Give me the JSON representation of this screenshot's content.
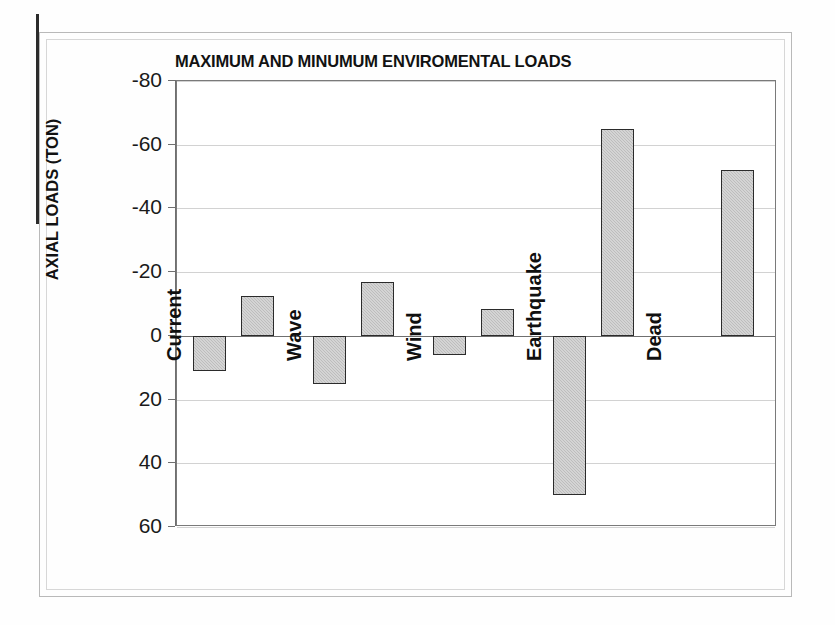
{
  "chart_data": {
    "type": "bar",
    "title": "MAXIMUM AND MINUMUM ENVIROMENTAL LOADS",
    "xlabel": "",
    "ylabel": "AXIAL LOADS (TON)",
    "ylim": [
      -80,
      60
    ],
    "y_axis_inverted": true,
    "grid": true,
    "legend": "none",
    "y_ticks": [
      -80,
      -60,
      -40,
      -20,
      0,
      20,
      40,
      60
    ],
    "y_tick_labels": [
      "-80",
      "-60",
      "-40",
      "-20",
      "0",
      "20",
      "40",
      "60"
    ],
    "categories": [
      "Current",
      "Wave",
      "Wind",
      "Earthquake",
      "Dead"
    ],
    "series": [
      {
        "name": "Maximum",
        "values": [
          -12.5,
          -17,
          -8.5,
          -65,
          -52
        ]
      },
      {
        "name": "Minimum",
        "values": [
          11,
          15,
          6,
          50,
          0
        ]
      }
    ]
  },
  "axis": {
    "y_title": "AXIAL LOADS (TON)",
    "ticks": [
      {
        "label": "-80",
        "value": -80
      },
      {
        "label": "-60",
        "value": -60
      },
      {
        "label": "-40",
        "value": -40
      },
      {
        "label": "-20",
        "value": -20
      },
      {
        "label": "0",
        "value": 0
      },
      {
        "label": "20",
        "value": 20
      },
      {
        "label": "40",
        "value": 40
      },
      {
        "label": "60",
        "value": 60
      }
    ]
  },
  "bars": [
    {
      "category": "Current",
      "series": "Minimum",
      "value": 11
    },
    {
      "category": "Current",
      "series": "Maximum",
      "value": -12.5
    },
    {
      "category": "Wave",
      "series": "Minimum",
      "value": 15
    },
    {
      "category": "Wave",
      "series": "Maximum",
      "value": -17
    },
    {
      "category": "Wind",
      "series": "Minimum",
      "value": 6
    },
    {
      "category": "Wind",
      "series": "Maximum",
      "value": -8.5
    },
    {
      "category": "Earthquake",
      "series": "Minimum",
      "value": 50
    },
    {
      "category": "Earthquake",
      "series": "Maximum",
      "value": -65
    },
    {
      "category": "Dead",
      "series": "Maximum",
      "value": -52
    }
  ],
  "category_labels": [
    "Current",
    "Wave",
    "Wind",
    "Earthquake",
    "Dead"
  ],
  "colors": {
    "bar_fill": "#bdbdbd",
    "bar_border": "#2b2b2b",
    "gridline": "#d2d2d2",
    "axis": "#6f6f6f",
    "text": "#121212",
    "background": "#ffffff"
  }
}
